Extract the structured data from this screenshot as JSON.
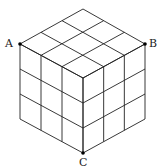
{
  "diagram": {
    "type": "cube-3x3x3",
    "divisions": 3,
    "labels": {
      "A": "A",
      "B": "B",
      "C": "C"
    },
    "line_color": "#222222",
    "point_color": "#000000"
  }
}
